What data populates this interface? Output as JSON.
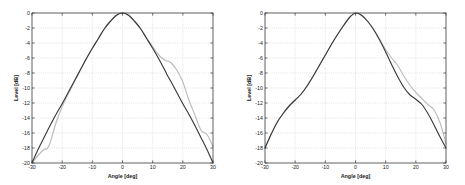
{
  "figure": {
    "background_color": "#ffffff",
    "panel_count": 2
  },
  "chart_data": [
    {
      "type": "line",
      "title": "",
      "subtitle": "",
      "xlabel": "Angle [deg]",
      "ylabel": "Level [dB]",
      "xlim": [
        -30,
        30
      ],
      "ylim": [
        -20,
        0
      ],
      "xticks": [
        -30,
        -20,
        -10,
        0,
        10,
        20,
        30
      ],
      "xticklabels": [
        "-30",
        "-20",
        "-10",
        "0",
        "10",
        "20",
        "30"
      ],
      "yticks": [
        0,
        -2,
        -4,
        -6,
        -8,
        -10,
        -12,
        -14,
        -16,
        -18,
        -20
      ],
      "yticklabels": [
        "0",
        "-2",
        "-4",
        "-6",
        "-8",
        "-10",
        "-12",
        "-14",
        "-16",
        "-18",
        "-20"
      ],
      "grid": true,
      "legend": "none",
      "colors": {
        "measured": "#bcbcbc",
        "model": "#3b3b3b"
      },
      "x": [
        -30,
        -28,
        -26,
        -25,
        -24,
        -22,
        -20,
        -18,
        -16,
        -14,
        -12,
        -10,
        -8,
        -6,
        -4,
        -2,
        0,
        2,
        4,
        6,
        8,
        10,
        12,
        14,
        15,
        16,
        18,
        20,
        22,
        24,
        26,
        28,
        30
      ],
      "series": [
        {
          "name": "model",
          "color": "#3b3b3b",
          "values": [
            -20.0,
            -18.2,
            -16.6,
            -15.8,
            -15.0,
            -13.5,
            -12.1,
            -10.6,
            -9.1,
            -7.6,
            -6.1,
            -4.7,
            -3.4,
            -2.1,
            -1.1,
            -0.3,
            0.0,
            -0.3,
            -1.1,
            -2.1,
            -3.4,
            -4.7,
            -6.1,
            -7.6,
            -8.4,
            -9.1,
            -10.6,
            -12.1,
            -13.5,
            -15.0,
            -16.6,
            -18.2,
            -20.0
          ]
        },
        {
          "name": "measured",
          "color": "#bcbcbc",
          "values": [
            -20.0,
            -19.0,
            -18.2,
            -18.1,
            -17.3,
            -14.6,
            -12.5,
            -10.8,
            -9.2,
            -7.6,
            -6.1,
            -4.7,
            -3.4,
            -2.1,
            -1.1,
            -0.3,
            0.0,
            -0.3,
            -1.1,
            -2.1,
            -3.3,
            -4.5,
            -5.6,
            -6.3,
            -6.4,
            -6.6,
            -7.6,
            -9.2,
            -11.6,
            -13.6,
            -15.6,
            -16.2,
            -17.8
          ]
        }
      ]
    },
    {
      "type": "line",
      "title": "",
      "subtitle": "",
      "xlabel": "Angle [deg]",
      "ylabel": "Level [dB]",
      "xlim": [
        -30,
        30
      ],
      "ylim": [
        -20,
        0
      ],
      "xticks": [
        -30,
        -20,
        -10,
        0,
        10,
        20,
        30
      ],
      "xticklabels": [
        "-30",
        "-20",
        "-10",
        "0",
        "10",
        "20",
        "30"
      ],
      "yticks": [
        0,
        -2,
        -4,
        -6,
        -8,
        -10,
        -12,
        -14,
        -16,
        -18,
        -20
      ],
      "yticklabels": [
        "0",
        "-2",
        "-4",
        "-6",
        "-8",
        "-10",
        "-12",
        "-14",
        "-16",
        "-18",
        "-20"
      ],
      "grid": true,
      "legend": "none",
      "colors": {
        "measured": "#bcbcbc",
        "model": "#3b3b3b"
      },
      "x": [
        -30,
        -28,
        -26,
        -24,
        -22,
        -20,
        -18,
        -16,
        -14,
        -12,
        -10,
        -8,
        -6,
        -4,
        -2,
        0,
        2,
        4,
        6,
        8,
        10,
        12,
        14,
        16,
        18,
        20,
        22,
        24,
        26,
        28,
        30
      ],
      "series": [
        {
          "name": "model",
          "color": "#3b3b3b",
          "values": [
            -18.0,
            -16.2,
            -14.6,
            -13.4,
            -12.4,
            -11.6,
            -10.8,
            -9.7,
            -8.4,
            -7.0,
            -5.6,
            -4.2,
            -2.9,
            -1.7,
            -0.6,
            0.0,
            -0.3,
            -1.1,
            -2.2,
            -3.6,
            -5.2,
            -6.9,
            -8.5,
            -9.9,
            -10.9,
            -11.5,
            -12.2,
            -13.4,
            -14.9,
            -16.5,
            -18.0
          ]
        },
        {
          "name": "measured",
          "color": "#bcbcbc",
          "values": [
            -18.0,
            -16.2,
            -14.6,
            -13.4,
            -12.4,
            -11.6,
            -10.8,
            -9.7,
            -8.4,
            -7.0,
            -5.6,
            -4.2,
            -2.9,
            -1.7,
            -0.6,
            0.0,
            -0.3,
            -1.1,
            -2.2,
            -3.5,
            -4.9,
            -6.0,
            -7.0,
            -8.4,
            -9.6,
            -10.6,
            -11.4,
            -12.2,
            -12.9,
            -14.6,
            -17.4
          ]
        }
      ]
    }
  ]
}
